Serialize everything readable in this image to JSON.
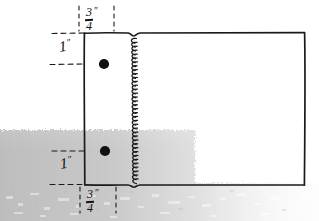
{
  "drawing": {
    "title": "spiral-bound notebook cover dimension sketch",
    "ink_color": "#111111",
    "paper_color": "#ffffff",
    "shadow_color": "#c9c9c9"
  },
  "annotations": {
    "top_width": {
      "numerator": "3",
      "denominator": "4",
      "unit": "″",
      "value": "3/4″"
    },
    "bottom_width": {
      "numerator": "3",
      "denominator": "4",
      "unit": "″",
      "value": "3/4″"
    },
    "top_height": {
      "number": "1",
      "unit": "″",
      "value": "1″"
    },
    "bottom_height": {
      "number": "1",
      "unit": "″",
      "value": "1″"
    }
  },
  "features": {
    "holes": [
      {
        "name": "upper-hole",
        "cx": 104,
        "cy": 64,
        "r": 5
      },
      {
        "name": "lower-hole",
        "cx": 105,
        "cy": 151,
        "r": 5
      }
    ],
    "cover_rect": {
      "x": 84,
      "y": 33,
      "w": 221,
      "h": 152
    },
    "binding_x": 133
  }
}
